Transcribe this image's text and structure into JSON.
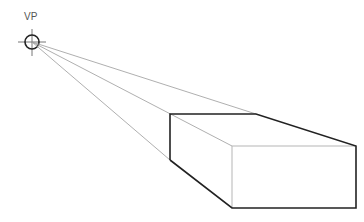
{
  "diagram": {
    "vanishing_point": {
      "label": "VP",
      "x": 32,
      "y": 42,
      "radius": 7
    },
    "colors": {
      "edge": "#222222",
      "guide": "#9a9a9a",
      "hidden_edge": "#b5b5b5",
      "vp": "#333333"
    },
    "box": {
      "back_top_left": [
        170,
        114
      ],
      "back_top_right": [
        256,
        114
      ],
      "back_bottom_left": [
        170,
        160
      ],
      "front_top_left": [
        232,
        146
      ],
      "front_top_right": [
        356,
        146
      ],
      "front_bottom_left": [
        232,
        208
      ],
      "front_bottom_right": [
        356,
        208
      ]
    }
  }
}
